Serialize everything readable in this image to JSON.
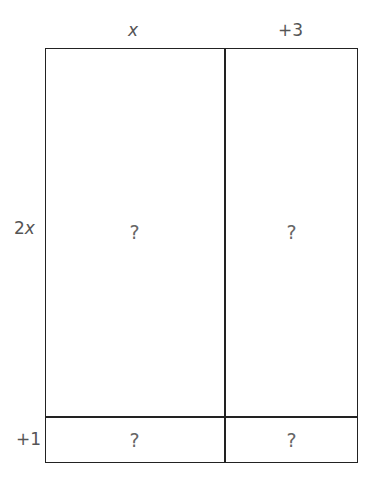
{
  "diagram": {
    "type": "area-model",
    "column_labels": [
      "x",
      "+3"
    ],
    "row_labels": [
      "2x",
      "+1"
    ],
    "cells": [
      [
        "?",
        "?"
      ],
      [
        "?",
        "?"
      ]
    ]
  },
  "colors": {
    "line": "#222222",
    "text": "#555555"
  }
}
